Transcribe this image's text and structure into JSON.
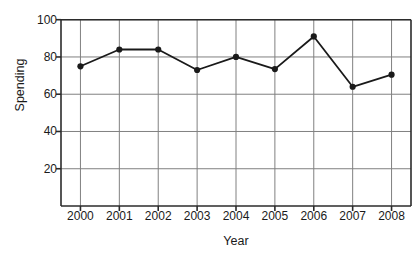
{
  "chart_data": {
    "type": "line",
    "title": "",
    "title_note": "title is cut off above the top edge of the screenshot; only descender fragments visible",
    "xlabel": "Year",
    "ylabel": "Spending",
    "categories": [
      "2000",
      "2001",
      "2002",
      "2003",
      "2004",
      "2005",
      "2006",
      "2007",
      "2008"
    ],
    "x": [
      2000,
      2001,
      2002,
      2003,
      2004,
      2005,
      2006,
      2007,
      2008
    ],
    "values": [
      75,
      84,
      84,
      73,
      80,
      73.5,
      91,
      64,
      70.5
    ],
    "series": [
      {
        "name": "Spending",
        "values": [
          75,
          84,
          84,
          73,
          80,
          73.5,
          91,
          64,
          70.5
        ]
      }
    ],
    "ylim": [
      0,
      100
    ],
    "xlim": [
      1999.5,
      2008.5
    ],
    "yticks": [
      20,
      40,
      60,
      80,
      100
    ],
    "ytick_labels": [
      "20",
      "40",
      "60",
      "80",
      "100"
    ],
    "xtick_labels": [
      "2000",
      "2001",
      "2002",
      "2003",
      "2004",
      "2005",
      "2006",
      "2007",
      "2008"
    ],
    "grid": true,
    "grid_axis": "both",
    "legend": false,
    "legend_position": "none",
    "marker": "filled-circle",
    "line_color": "#1a1a1a",
    "marker_color": "#1a1a1a",
    "grid_color": "#808080",
    "axis_color": "#2b2b2b",
    "background_color": "#ffffff"
  },
  "axes": {
    "y_title": "Spending",
    "x_title": "Year"
  }
}
